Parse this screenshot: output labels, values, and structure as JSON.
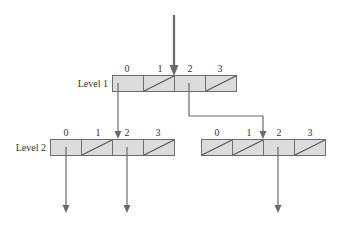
{
  "diagram": {
    "type": "multilevel-index-tree",
    "levels": [
      {
        "label": "Level 1",
        "tables": [
          {
            "indices": [
              "0",
              "1",
              "2",
              "3"
            ],
            "entries": [
              "pointer",
              "null",
              "pointer",
              "null"
            ]
          }
        ]
      },
      {
        "label": "Level 2",
        "tables": [
          {
            "indices": [
              "0",
              "1",
              "2",
              "3"
            ],
            "entries": [
              "pointer",
              "null",
              "pointer",
              "null"
            ]
          },
          {
            "indices": [
              "0",
              "1",
              "2",
              "3"
            ],
            "entries": [
              "null",
              "null",
              "pointer",
              "null"
            ]
          }
        ]
      }
    ],
    "edges": [
      {
        "from": "entry",
        "to": "Level 1 table"
      },
      {
        "from": "Level 1 entry 0",
        "to": "Level 2 left table"
      },
      {
        "from": "Level 1 entry 2",
        "to": "Level 2 right table"
      },
      {
        "from": "Level 2 left entry 0",
        "to": "next level"
      },
      {
        "from": "Level 2 left entry 2",
        "to": "next level"
      },
      {
        "from": "Level 2 right entry 2",
        "to": "next level"
      }
    ],
    "colors": {
      "cell_fill": "#dcdcdc",
      "border": "#6e6e6e",
      "arrow": "#6a6a6a"
    }
  }
}
